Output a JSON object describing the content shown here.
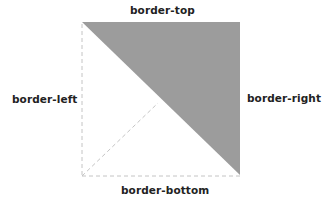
{
  "diagram": {
    "labels": {
      "top": "border-top",
      "left": "border-left",
      "right": "border-right",
      "bottom": "border-bottom"
    },
    "colors": {
      "filled_region": "#9c9c9c",
      "dashed_lines": "#c8c8c8",
      "text": "#222222"
    },
    "filled_region": "border-top + border-right (upper-right triangle)"
  }
}
